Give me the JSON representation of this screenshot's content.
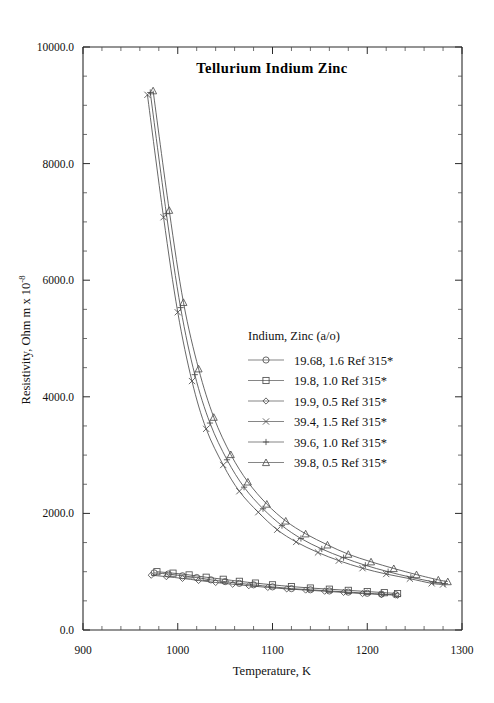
{
  "chart_data": {
    "type": "line",
    "title": "Tellurium  Indium  Zinc",
    "xlabel": "Temperature,  K",
    "ylabel": "Resistivity, Ohm m x 10",
    "ylabel_exponent": "-8",
    "xlim": [
      900,
      1300
    ],
    "ylim": [
      0.0,
      10000.0
    ],
    "x_ticks": [
      900,
      1000,
      1100,
      1200,
      1300
    ],
    "x_tick_labels": [
      "900",
      "1000",
      "1100",
      "1200",
      "1300"
    ],
    "x_minor_interval": 20,
    "y_ticks": [
      0.0,
      2000.0,
      4000.0,
      6000.0,
      8000.0,
      10000.0
    ],
    "y_tick_labels": [
      "0.0",
      "2000.0",
      "4000.0",
      "6000.0",
      "8000.0",
      "10000.0"
    ],
    "y_minor_interval": 500,
    "grid": false,
    "legend_position": "center-right",
    "legend_title": "Indium, Zinc (a/o)",
    "series": [
      {
        "name": "19.68, 1.6 Ref 315*",
        "marker": "circle",
        "x": [
          975,
          990,
          1005,
          1020,
          1035,
          1050,
          1065,
          1080,
          1100,
          1120,
          1140,
          1160,
          1180,
          1200,
          1215,
          1230
        ],
        "y": [
          980,
          960,
          930,
          900,
          860,
          830,
          800,
          775,
          740,
          710,
          690,
          670,
          650,
          630,
          615,
          605
        ]
      },
      {
        "name": "19.8, 1.0 Ref 315*",
        "marker": "square",
        "x": [
          978,
          995,
          1012,
          1030,
          1048,
          1065,
          1082,
          1100,
          1120,
          1140,
          1160,
          1180,
          1200,
          1218,
          1232
        ],
        "y": [
          1000,
          975,
          945,
          905,
          870,
          835,
          805,
          775,
          745,
          720,
          700,
          680,
          660,
          640,
          625
        ]
      },
      {
        "name": "19.9, 0.5 Ref 315*",
        "marker": "diamond",
        "x": [
          972,
          988,
          1005,
          1022,
          1040,
          1058,
          1075,
          1095,
          1115,
          1135,
          1155,
          1175,
          1195,
          1215,
          1232
        ],
        "y": [
          940,
          915,
          885,
          850,
          815,
          785,
          760,
          730,
          705,
          685,
          665,
          645,
          625,
          610,
          595
        ]
      },
      {
        "name": "39.4, 1.5 Ref 315*",
        "marker": "cross",
        "x": [
          968,
          985,
          1000,
          1015,
          1030,
          1048,
          1065,
          1085,
          1105,
          1125,
          1148,
          1170,
          1195,
          1220,
          1245,
          1268,
          1280
        ],
        "y": [
          9180,
          7080,
          5450,
          4270,
          3450,
          2830,
          2380,
          2020,
          1720,
          1510,
          1330,
          1190,
          1060,
          960,
          880,
          800,
          780
        ]
      },
      {
        "name": "39.6, 1.0 Ref 315*",
        "marker": "plus",
        "x": [
          971,
          988,
          1003,
          1018,
          1034,
          1052,
          1070,
          1090,
          1110,
          1130,
          1152,
          1175,
          1198,
          1222,
          1246,
          1270,
          1282
        ],
        "y": [
          9220,
          7140,
          5530,
          4380,
          3550,
          2920,
          2450,
          2080,
          1790,
          1570,
          1390,
          1240,
          1110,
          1000,
          905,
          825,
          795
        ]
      },
      {
        "name": "39.8, 0.5 Ref 315*",
        "marker": "triangle",
        "x": [
          974,
          991,
          1006,
          1022,
          1038,
          1056,
          1074,
          1094,
          1114,
          1135,
          1158,
          1180,
          1204,
          1228,
          1252,
          1275,
          1285
        ],
        "y": [
          9250,
          7200,
          5620,
          4480,
          3650,
          3010,
          2540,
          2160,
          1870,
          1650,
          1460,
          1300,
          1170,
          1055,
          950,
          860,
          830
        ]
      }
    ]
  }
}
